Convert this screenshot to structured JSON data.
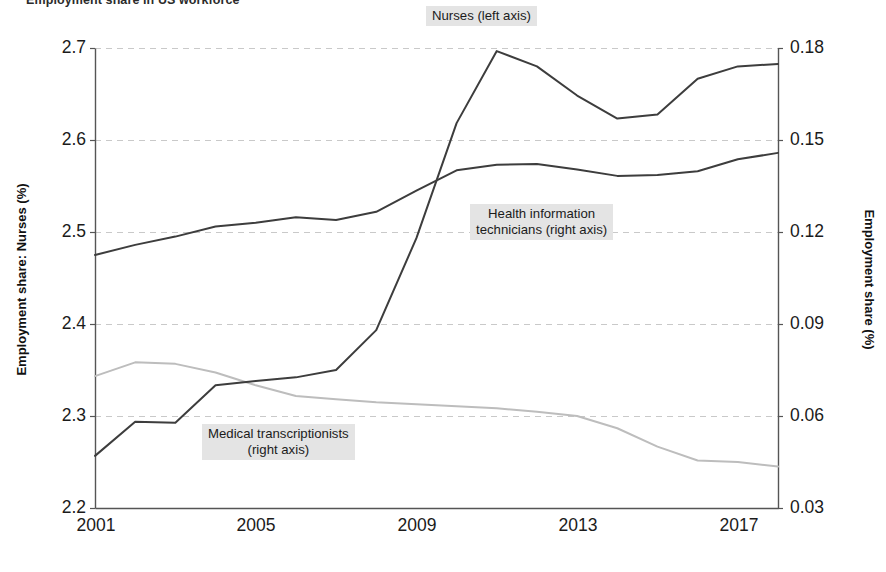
{
  "figure": {
    "title": "Employment share in US workforce"
  },
  "axes": {
    "left": {
      "title": "Employment share: Nurses (%)",
      "ticks": [
        "2.2",
        "2.3",
        "2.4",
        "2.5",
        "2.6",
        "2.7"
      ],
      "min": 2.2,
      "max": 2.7
    },
    "right": {
      "title": "Employment share (%)",
      "ticks": [
        "0.03",
        "0.06",
        "0.09",
        "0.12",
        "0.15",
        "0.18"
      ],
      "min": 0.03,
      "max": 0.18
    },
    "x": {
      "ticks": [
        "2001",
        "2005",
        "2009",
        "2013",
        "2017"
      ],
      "min": 2001,
      "max": 2018
    }
  },
  "annotations": {
    "nurses": "Nurses (left axis)",
    "hit_line1": "Health information",
    "hit_line2": "technicians (right axis)",
    "mt_line1": "Medical transcriptionists",
    "mt_line2": "(right axis)"
  },
  "colors": {
    "nurses_line": "#3d3d3d",
    "hit_line": "#3d3d3d",
    "mt_line": "#bdbdbd",
    "gridline": "#c9c9c9",
    "axis": "#555555",
    "label_bg": "#e4e4e4"
  },
  "chart_data": {
    "type": "line",
    "title": "Employment share in US workforce",
    "xlabel": "",
    "ylabel": "Employment share: Nurses (%)",
    "ylabel_right": "Employment share (%)",
    "xlim": [
      2001,
      2018
    ],
    "ylim": [
      2.2,
      2.7
    ],
    "ylim_right": [
      0.03,
      0.18
    ],
    "grid": true,
    "legend": "inline-annotations",
    "x": [
      2001,
      2002,
      2003,
      2004,
      2005,
      2006,
      2007,
      2008,
      2009,
      2010,
      2011,
      2012,
      2013,
      2014,
      2015,
      2016,
      2017,
      2018
    ],
    "series": [
      {
        "name": "Nurses (left axis)",
        "axis": "left",
        "color": "#3d3d3d",
        "values": [
          2.475,
          2.486,
          2.495,
          2.506,
          2.51,
          2.516,
          2.513,
          2.522,
          2.545,
          2.567,
          2.573,
          2.574,
          2.568,
          2.561,
          2.562,
          2.566,
          2.579,
          2.586
        ]
      },
      {
        "name": "Health information technicians (right axis)",
        "axis": "right",
        "color": "#3d3d3d",
        "values": [
          0.047,
          0.0581,
          0.0578,
          0.07,
          0.0714,
          0.0726,
          0.075,
          0.088,
          0.118,
          0.1555,
          0.179,
          0.174,
          0.1645,
          0.157,
          0.1583,
          0.17,
          0.174,
          0.1748
        ]
      },
      {
        "name": "Medical transcriptionists (right axis)",
        "axis": "right",
        "color": "#bdbdbd",
        "values": [
          0.073,
          0.0775,
          0.077,
          0.0742,
          0.07,
          0.0665,
          0.0655,
          0.0645,
          0.0638,
          0.0632,
          0.0625,
          0.0614,
          0.06,
          0.056,
          0.05,
          0.0455,
          0.045,
          0.0435
        ]
      }
    ]
  }
}
